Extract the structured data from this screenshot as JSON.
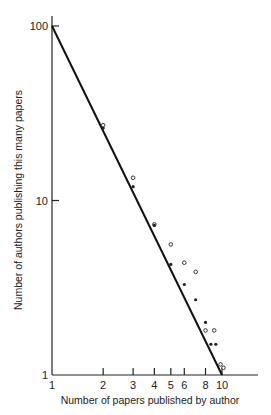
{
  "chart_data": {
    "type": "scatter",
    "title": "",
    "xlabel": "Number of papers published by author",
    "ylabel": "Number of authors publishing this many papers",
    "x_scale": "log",
    "y_scale": "log",
    "xlim": [
      1,
      16
    ],
    "ylim": [
      1,
      100
    ],
    "x_ticks": [
      1,
      2,
      3,
      4,
      5,
      6,
      8,
      10
    ],
    "x_tick_labels": [
      "1",
      "2",
      "3",
      "4",
      "5",
      "6",
      "8",
      "10"
    ],
    "y_ticks": [
      1,
      10,
      100
    ],
    "y_tick_labels": [
      "1",
      "10",
      "100"
    ],
    "grid": false,
    "legend": null,
    "series": [
      {
        "name": "Open circles",
        "marker": "open-circle",
        "points": [
          [
            2,
            27
          ],
          [
            3,
            13.5
          ],
          [
            4,
            7.3
          ],
          [
            5,
            5.6
          ],
          [
            6,
            4.4
          ],
          [
            7,
            3.9
          ],
          [
            8,
            1.8
          ],
          [
            9,
            1.8
          ],
          [
            9.8,
            1.15
          ],
          [
            10.2,
            1.1
          ]
        ]
      },
      {
        "name": "Filled dots",
        "marker": "filled-dot",
        "points": [
          [
            2,
            26
          ],
          [
            3,
            12
          ],
          [
            4,
            7.2
          ],
          [
            5,
            4.3
          ],
          [
            6,
            3.3
          ],
          [
            7,
            2.7
          ],
          [
            8,
            2.0
          ],
          [
            8.6,
            1.5
          ],
          [
            9.2,
            1.5
          ]
        ]
      },
      {
        "name": "Inverse square law line",
        "type": "line",
        "points": [
          [
            1,
            100
          ],
          [
            10,
            1
          ]
        ]
      }
    ]
  }
}
